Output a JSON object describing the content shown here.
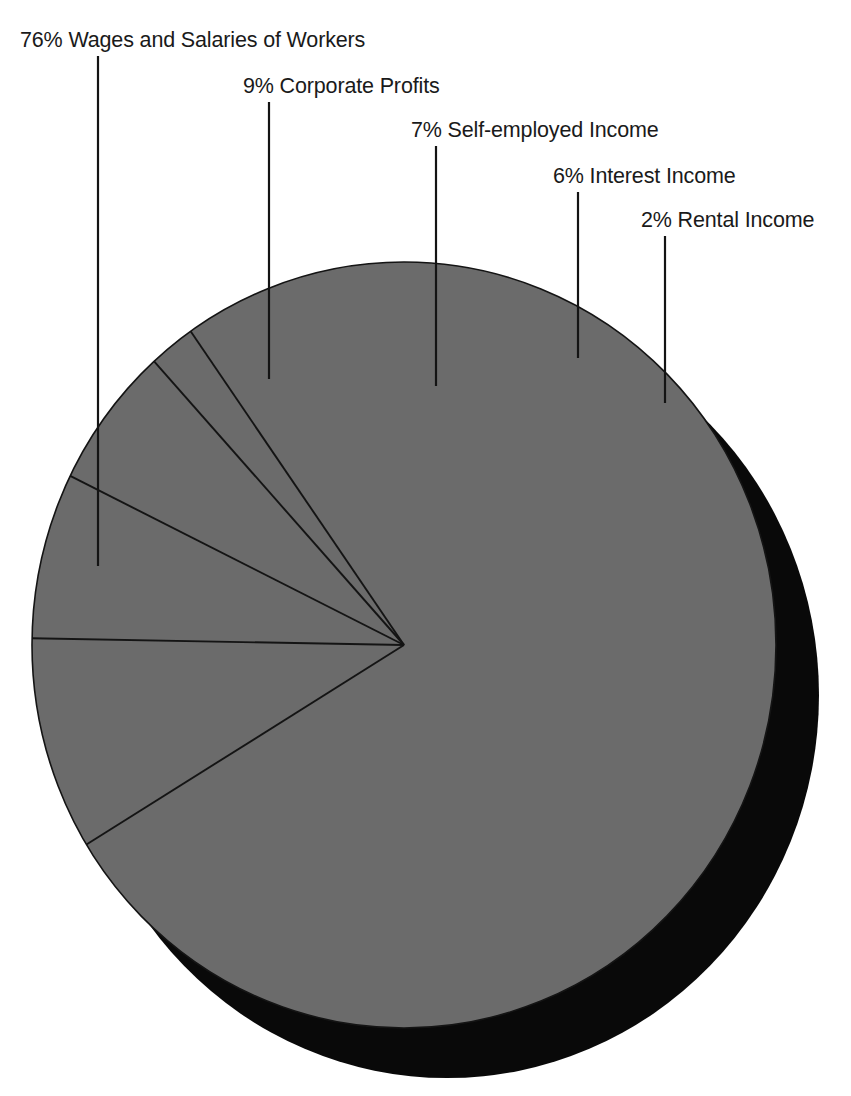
{
  "figure": {
    "background_color": "#ffffff",
    "slice_fill_color": "#6b6b6b",
    "shadow_color": "#090909",
    "outline_color": "#141414",
    "text_color": "#1a1a1a"
  },
  "chart_data": {
    "type": "pie",
    "title": "",
    "subtitle": "",
    "xlabel": "",
    "ylabel": "",
    "legend_position": "callout-labels",
    "grid": false,
    "total_percent": 100,
    "categories": [
      "Wages and Salaries of Workers",
      "Corporate Profits",
      "Self-employed Income",
      "Interest Income",
      "Rental Income"
    ],
    "values": [
      76,
      9,
      7,
      6,
      2
    ],
    "value_unit": "%",
    "labels": [
      "76% Wages and Salaries of Workers",
      "9% Corporate Profits",
      "7% Self-employed Income",
      "6% Interest Income",
      "2% Rental Income"
    ],
    "slices": [
      {
        "label": "76% Wages and Salaries of Workers",
        "percent_text": "76%",
        "name": "Wages and Salaries of Workers",
        "value": 76,
        "label_x": 20,
        "label_y": 30,
        "leader_x": 98,
        "leader_y_top": 56,
        "leader_y_bottom": 566
      },
      {
        "label": "9% Corporate Profits",
        "percent_text": "9%",
        "name": "Corporate Profits",
        "value": 9,
        "label_x": 243,
        "label_y": 76,
        "leader_x": 269,
        "leader_y_top": 102,
        "leader_y_bottom": 379
      },
      {
        "label": "7% Self-employed Income",
        "percent_text": "7%",
        "name": "Self-employed Income",
        "value": 7,
        "label_x": 411,
        "label_y": 120,
        "leader_x": 436,
        "leader_y_top": 146,
        "leader_y_bottom": 386
      },
      {
        "label": "6% Interest Income",
        "percent_text": "6%",
        "name": "Interest Income",
        "value": 6,
        "label_x": 553,
        "label_y": 166,
        "leader_x": 578,
        "leader_y_top": 192,
        "leader_y_bottom": 358
      },
      {
        "label": "2% Rental Income",
        "percent_text": "2%",
        "name": "Rental Income",
        "value": 2,
        "label_x": 641,
        "label_y": 210,
        "leader_x": 665,
        "leader_y_top": 236,
        "leader_y_bottom": 403
      }
    ],
    "geometry": {
      "center_x": 404,
      "center_y": 645,
      "radius_x": 372,
      "radius_y": 383,
      "shadow_offset_x": 43,
      "shadow_offset_y": 50,
      "start_angle_deg": -125,
      "sweep_direction": "clockwise"
    }
  }
}
